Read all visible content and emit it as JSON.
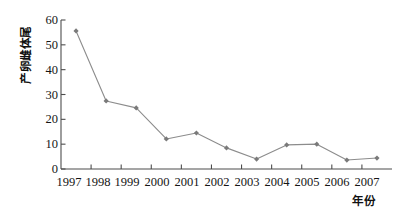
{
  "chart_data": {
    "type": "line",
    "title": "",
    "xlabel": "年份",
    "ylabel": "产卵雌体尾",
    "categories": [
      "1997",
      "1998",
      "1999",
      "2000",
      "2001",
      "2002",
      "2003",
      "2004",
      "2005",
      "2006",
      "2007"
    ],
    "values": [
      55.6,
      27.4,
      24.6,
      12.1,
      14.5,
      8.5,
      4.0,
      9.7,
      10.0,
      3.6,
      4.4
    ],
    "series": [
      {
        "name": "产卵雌体尾",
        "values": [
          55.6,
          27.4,
          24.6,
          12.1,
          14.5,
          8.5,
          4.0,
          9.7,
          10.0,
          3.6,
          4.4
        ]
      }
    ],
    "ylim": [
      0,
      60
    ],
    "yticks": [
      0,
      10,
      20,
      30,
      40,
      50,
      60
    ],
    "ytick_labels": [
      "0",
      "10",
      "20",
      "30",
      "40",
      "50",
      "60"
    ],
    "grid": false,
    "legend": "none",
    "marker": "diamond",
    "line_color": "#8c8c8c",
    "marker_color": "#7a7a7a",
    "axis_color": "#4d4d4d"
  },
  "axis": {
    "y_title": "产卵雌体尾",
    "x_title": "年份"
  }
}
